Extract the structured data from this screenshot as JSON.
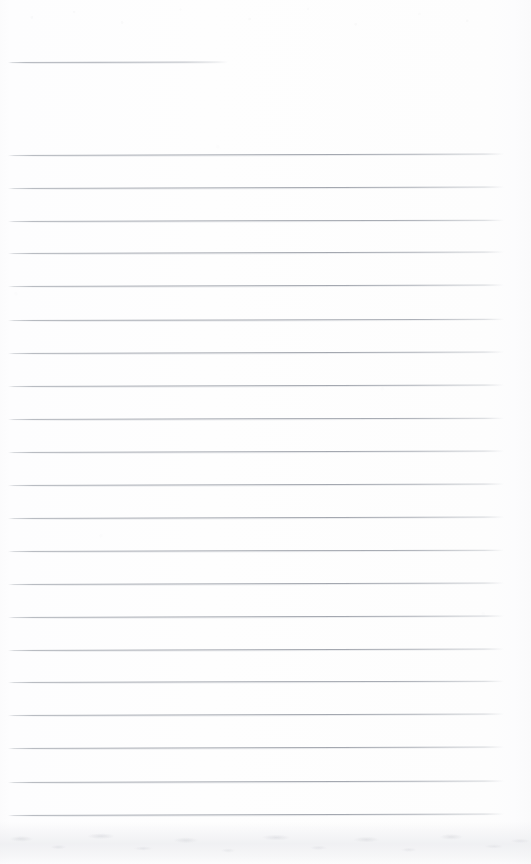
{
  "document": {
    "type": "scanned-lined-notebook-page",
    "title": "Blank Lined Page",
    "content_text": "",
    "width": 531,
    "height": 864,
    "orientation": "portrait"
  },
  "colors": {
    "paper": "#fdfdfd",
    "rule_line": "#a3a7af",
    "rule_line_faded": "#c4c7cc",
    "bottom_band": "#ecedf0"
  },
  "ruling": {
    "style": "wide-ruled",
    "line_count": 24,
    "line_spacing_px": 33.2,
    "line_thickness_px": 1,
    "left_margin_px": 8,
    "right_margin_px": 27,
    "first_line_y_px": 62,
    "last_line_y_px": 815,
    "header_gap_px": 93,
    "has_vertical_margin_rule": false
  },
  "lines": [
    {
      "index": 1,
      "y": 62,
      "x_start": 8,
      "x_end": 228,
      "length": 220,
      "tilt_deg": -0.12,
      "variant": "short",
      "text": ""
    },
    {
      "index": 2,
      "y": 155,
      "x_start": 8,
      "x_end": 504,
      "length": 496,
      "tilt_deg": -0.16,
      "variant": "full",
      "text": ""
    },
    {
      "index": 3,
      "y": 188,
      "x_start": 8,
      "x_end": 504,
      "length": 496,
      "tilt_deg": -0.18,
      "variant": "full",
      "text": ""
    },
    {
      "index": 4,
      "y": 221,
      "x_start": 8,
      "x_end": 504,
      "length": 496,
      "tilt_deg": -0.15,
      "variant": "full",
      "text": ""
    },
    {
      "index": 5,
      "y": 253,
      "x_start": 8,
      "x_end": 504,
      "length": 496,
      "tilt_deg": -0.17,
      "variant": "full",
      "text": ""
    },
    {
      "index": 6,
      "y": 286,
      "x_start": 8,
      "x_end": 504,
      "length": 496,
      "tilt_deg": -0.16,
      "variant": "full",
      "text": ""
    },
    {
      "index": 7,
      "y": 320,
      "x_start": 8,
      "x_end": 504,
      "length": 496,
      "tilt_deg": -0.14,
      "variant": "full",
      "text": ""
    },
    {
      "index": 8,
      "y": 353,
      "x_start": 8,
      "x_end": 504,
      "length": 496,
      "tilt_deg": -0.17,
      "variant": "full",
      "text": ""
    },
    {
      "index": 9,
      "y": 386,
      "x_start": 8,
      "x_end": 504,
      "length": 496,
      "tilt_deg": -0.16,
      "variant": "full",
      "text": ""
    },
    {
      "index": 10,
      "y": 419,
      "x_start": 8,
      "x_end": 504,
      "length": 496,
      "tilt_deg": -0.15,
      "variant": "full",
      "text": ""
    },
    {
      "index": 11,
      "y": 452,
      "x_start": 8,
      "x_end": 504,
      "length": 496,
      "tilt_deg": -0.18,
      "variant": "full",
      "text": ""
    },
    {
      "index": 12,
      "y": 485,
      "x_start": 8,
      "x_end": 504,
      "length": 496,
      "tilt_deg": -0.16,
      "variant": "full",
      "text": ""
    },
    {
      "index": 13,
      "y": 518,
      "x_start": 8,
      "x_end": 504,
      "length": 496,
      "tilt_deg": -0.17,
      "variant": "full",
      "text": ""
    },
    {
      "index": 14,
      "y": 551,
      "x_start": 8,
      "x_end": 504,
      "length": 496,
      "tilt_deg": -0.15,
      "variant": "full",
      "text": ""
    },
    {
      "index": 15,
      "y": 584,
      "x_start": 8,
      "x_end": 504,
      "length": 496,
      "tilt_deg": -0.16,
      "variant": "full",
      "text": ""
    },
    {
      "index": 16,
      "y": 617,
      "x_start": 8,
      "x_end": 504,
      "length": 496,
      "tilt_deg": -0.18,
      "variant": "full",
      "text": ""
    },
    {
      "index": 17,
      "y": 650,
      "x_start": 8,
      "x_end": 504,
      "length": 496,
      "tilt_deg": -0.16,
      "variant": "full",
      "text": ""
    },
    {
      "index": 18,
      "y": 682,
      "x_start": 8,
      "x_end": 504,
      "length": 496,
      "tilt_deg": -0.15,
      "variant": "full",
      "text": ""
    },
    {
      "index": 19,
      "y": 715,
      "x_start": 8,
      "x_end": 504,
      "length": 496,
      "tilt_deg": -0.17,
      "variant": "full",
      "text": ""
    },
    {
      "index": 20,
      "y": 748,
      "x_start": 8,
      "x_end": 504,
      "length": 496,
      "tilt_deg": -0.16,
      "variant": "full",
      "text": ""
    },
    {
      "index": 21,
      "y": 782,
      "x_start": 8,
      "x_end": 504,
      "length": 496,
      "tilt_deg": -0.18,
      "variant": "full",
      "text": ""
    },
    {
      "index": 22,
      "y": 815,
      "x_start": 8,
      "x_end": 504,
      "length": 496,
      "tilt_deg": -0.16,
      "variant": "full",
      "text": ""
    }
  ],
  "artifacts": {
    "bottom_band_label": "scan edge shadow",
    "bottom_band_top_y": 825,
    "speckle_label": "scanner speckle"
  }
}
